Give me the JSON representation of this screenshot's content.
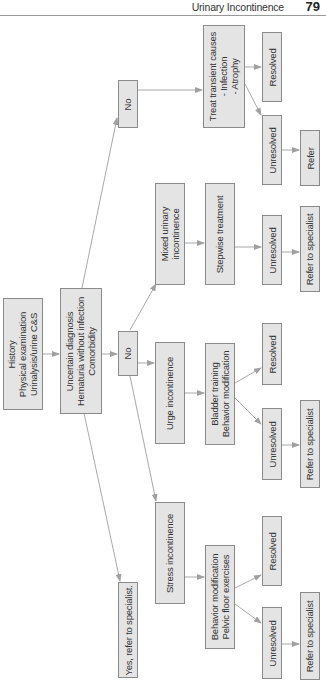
{
  "header": {
    "title": "Urinary Incontinence",
    "page_number": "79"
  },
  "flowchart": {
    "orientation": "rotated-90-ccw",
    "colors": {
      "box_fill": "#e4e4e4",
      "box_border": "#8a8a8a",
      "edge": "#a0a0a0"
    },
    "nodes": {
      "history": "History\nPhysical examination\nUrinalysis/urine C&S",
      "uncertain": "Uncertain diagnosis\nHematuria without infection\nComorbidity",
      "no_mid": "No",
      "no_top": "No",
      "yes_refer": "Yes, refer to specialist.",
      "stress": "Stress incontinence",
      "urge": "Urge incontinence",
      "mixed": "Mixed urinary\nincontinence",
      "treat_transient": "Treat transient causes\n- Infection\n- Atrophy",
      "behavior_pelvic": "Behavior modification\nPelvic floor exercises",
      "bladder_training": "Bladder training\nBehavior modification",
      "stepwise": "Stepwise treatment",
      "treat_resolved": "Resolved",
      "treat_unresolved": "Unresolved",
      "treat_refer": "Refer",
      "bladder_resolved": "Resolved",
      "bladder_unresolved": "Unresolved",
      "bladder_refer": "Refer to specialist",
      "stepwise_unresolved": "Unresolved",
      "stepwise_refer": "Refer to specialist",
      "pelvic_resolved": "Resolved",
      "pelvic_unresolved": "Unresolved",
      "pelvic_refer": "Refer to specialist"
    }
  }
}
